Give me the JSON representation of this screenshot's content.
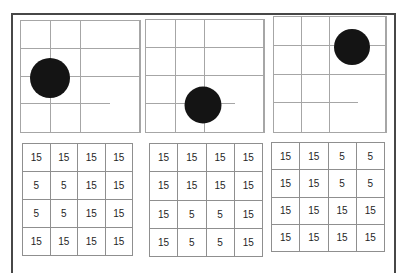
{
  "colors": {
    "background": "#ffffff",
    "frame_border": "#474747",
    "grid_line": "#a6a6a6",
    "table_border": "#8f8f8f",
    "dot": "#141414",
    "cell_text": "#1f1f1f"
  },
  "panels": [
    {
      "name": "left",
      "grid": {
        "rows": 4,
        "cols": 4
      },
      "dot": {
        "x_pct": 24,
        "y_pct": 51,
        "diameter_px": 40
      },
      "table": [
        [
          "15",
          "15",
          "15",
          "15"
        ],
        [
          "5",
          "5",
          "15",
          "15"
        ],
        [
          "5",
          "5",
          "15",
          "15"
        ],
        [
          "15",
          "15",
          "15",
          "15"
        ]
      ]
    },
    {
      "name": "middle",
      "grid": {
        "rows": 4,
        "cols": 4
      },
      "dot": {
        "x_pct": 48,
        "y_pct": 76,
        "diameter_px": 37
      },
      "table": [
        [
          "15",
          "15",
          "15",
          "15"
        ],
        [
          "15",
          "15",
          "15",
          "15"
        ],
        [
          "15",
          "5",
          "5",
          "15"
        ],
        [
          "15",
          "5",
          "5",
          "15"
        ]
      ]
    },
    {
      "name": "right",
      "grid": {
        "rows": 4,
        "cols": 4
      },
      "dot": {
        "x_pct": 70,
        "y_pct": 26,
        "diameter_px": 36
      },
      "table": [
        [
          "15",
          "15",
          "5",
          "5"
        ],
        [
          "15",
          "15",
          "5",
          "5"
        ],
        [
          "15",
          "15",
          "15",
          "15"
        ],
        [
          "15",
          "15",
          "15",
          "15"
        ]
      ]
    }
  ]
}
